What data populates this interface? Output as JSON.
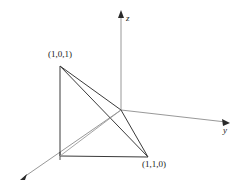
{
  "figure": {
    "type": "3d-coordinate-diagram",
    "background_color": "#ffffff",
    "axis_color": "#8c8c8c",
    "edge_color": "#3a3a3a",
    "label_color": "#1a1a1a",
    "axes": [
      {
        "name": "x",
        "label": "",
        "from": [
          121,
          110
        ],
        "to": [
          22,
          178
        ],
        "arrow": true
      },
      {
        "name": "y",
        "label": "y",
        "from": [
          121,
          110
        ],
        "to": [
          228,
          122
        ],
        "arrow": true
      },
      {
        "name": "z",
        "label": "z",
        "from": [
          121,
          110
        ],
        "to": [
          121,
          12
        ],
        "arrow": true
      }
    ],
    "origin": {
      "x": 121,
      "y": 110
    },
    "vertices": [
      {
        "id": "v101",
        "label": "(1,0,1)",
        "x": 60,
        "y": 66
      },
      {
        "id": "v100",
        "label": "",
        "x": 60,
        "y": 156
      },
      {
        "id": "v110",
        "label": "(1,1,0)",
        "x": 148,
        "y": 157
      },
      {
        "id": "origin",
        "label": "",
        "x": 121,
        "y": 110
      }
    ],
    "edges": [
      {
        "from": "v101",
        "to": "v100"
      },
      {
        "from": "v101",
        "to": "origin"
      },
      {
        "from": "v101",
        "to": "v110"
      },
      {
        "from": "v100",
        "to": "v110"
      },
      {
        "from": "origin",
        "to": "v110"
      },
      {
        "from": "v100",
        "to": "origin"
      }
    ],
    "tick_marks": [
      {
        "at": [
          60,
          156
        ],
        "axis": "x"
      }
    ],
    "labels": {
      "vertex_101": "(1,0,1)",
      "vertex_110": "(1,1,0)",
      "axis_z": "z",
      "axis_y": "y"
    }
  }
}
